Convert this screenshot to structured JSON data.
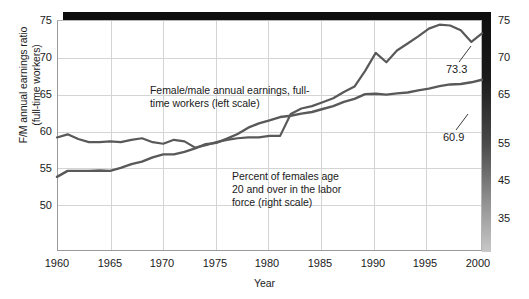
{
  "axes": {
    "y_left_title_line1": "F/M annual earnings ratio",
    "y_left_title_line2": "(full-time workers)",
    "x_title": "Year",
    "y_left_ticks": [
      "75",
      "70",
      "65",
      "60",
      "55",
      "50"
    ],
    "y_right_ticks": [
      "75",
      "70",
      "65",
      "55",
      "45",
      "35"
    ],
    "x_ticks": [
      "1960",
      "1965",
      "1970",
      "1975",
      "1980",
      "1985",
      "1990",
      "1995",
      "2000"
    ]
  },
  "annotations": {
    "earnings": "Female/male annual earnings, full-time workers (left scale)",
    "labor": "Percent of females age 20 and over in the labor force (right scale)",
    "earnings_end_value": "73.3",
    "labor_end_value": "60.9"
  },
  "colors": {
    "line": "#595959",
    "grid": "#d4d4d4",
    "frame": "#9a9a9a",
    "shadow": "#0d0d0d",
    "text": "#1a1a1a"
  },
  "chart_data": {
    "type": "line",
    "title": "",
    "xlabel": "Year",
    "ylabel": "F/M annual earnings ratio (full-time workers)",
    "xlim": [
      1960,
      2000
    ],
    "ylim_left": [
      45.5,
      75
    ],
    "ylim_right": [
      20.5,
      75
    ],
    "grid": true,
    "legend": "in-plot annotations",
    "x": [
      1960,
      1961,
      1962,
      1963,
      1964,
      1965,
      1966,
      1967,
      1968,
      1969,
      1970,
      1971,
      1972,
      1973,
      1974,
      1975,
      1976,
      1977,
      1978,
      1979,
      1980,
      1981,
      1982,
      1983,
      1984,
      1985,
      1986,
      1987,
      1988,
      1989,
      1990,
      1991,
      1992,
      1993,
      1994,
      1995,
      1996,
      1997,
      1998,
      1999,
      2000
    ],
    "series": [
      {
        "name": "Female/male annual earnings, full-time workers (left scale)",
        "axis": "left",
        "end_label": "73.3",
        "values": [
          60.0,
          60.4,
          59.8,
          59.4,
          59.4,
          59.5,
          59.4,
          59.7,
          59.9,
          59.4,
          59.2,
          59.7,
          59.5,
          58.7,
          59.0,
          59.4,
          59.7,
          59.9,
          60.0,
          60.0,
          60.2,
          60.2,
          63.0,
          63.7,
          64.0,
          64.5,
          65.0,
          65.8,
          66.5,
          68.5,
          70.8,
          69.6,
          71.1,
          72.0,
          72.9,
          73.9,
          74.4,
          74.3,
          73.7,
          72.2,
          73.3
        ]
      },
      {
        "name": "Percent of females age 20 and over in the labor force (right scale)",
        "axis": "right",
        "end_label": "60.9",
        "values": [
          38.0,
          39.4,
          39.4,
          39.4,
          39.5,
          39.4,
          40.1,
          41.0,
          41.6,
          42.6,
          43.3,
          43.3,
          43.9,
          44.7,
          45.7,
          46.0,
          47.0,
          48.1,
          49.6,
          50.6,
          51.3,
          52.1,
          52.4,
          52.9,
          53.3,
          54.0,
          54.7,
          55.7,
          56.4,
          57.5,
          57.6,
          57.4,
          57.7,
          57.9,
          58.4,
          58.8,
          59.4,
          59.8,
          59.9,
          60.3,
          60.9
        ]
      }
    ]
  }
}
